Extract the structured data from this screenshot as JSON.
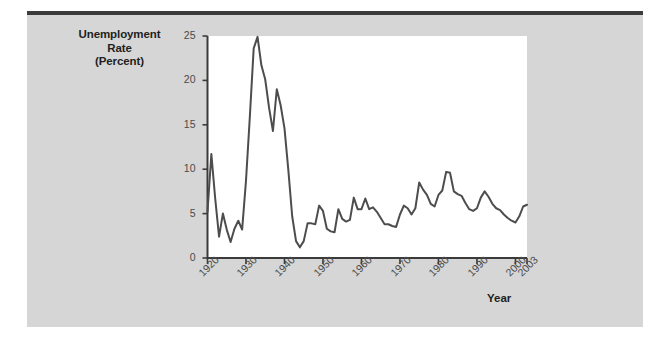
{
  "figure": {
    "background_color": "#d6d6d6",
    "plot_background_color": "#ffffff",
    "line_color": "#4d4d4d",
    "axis_color": "#3b3b3b",
    "text_color": "#231f20",
    "tick_text_color": "#4a4a4a"
  },
  "labels": {
    "y_axis_title_line1": "Unemployment",
    "y_axis_title_line2": "Rate",
    "y_axis_title_line3": "(Percent)",
    "x_axis_title": "Year"
  },
  "chart_data": {
    "type": "line",
    "title": "Unemployment Rate (Percent)",
    "xlabel": "Year",
    "ylabel": "Unemployment Rate (Percent)",
    "xlim": [
      1920,
      2003
    ],
    "ylim": [
      0,
      25
    ],
    "grid": false,
    "legend": "none",
    "y_ticks": [
      0,
      5,
      10,
      15,
      20,
      25
    ],
    "y_tick_labels": [
      "0",
      "5",
      "10",
      "15",
      "20",
      "25"
    ],
    "x_ticks": [
      1920,
      1930,
      1940,
      1950,
      1960,
      1970,
      1980,
      1990,
      2000,
      2003
    ],
    "x_tick_labels": [
      "1920",
      "1930",
      "1940",
      "1950",
      "1960",
      "1970",
      "1980",
      "1990",
      "2000",
      "2003"
    ],
    "series": [
      {
        "name": "Unemployment Rate",
        "x": [
          1920,
          1921,
          1922,
          1923,
          1924,
          1925,
          1926,
          1927,
          1928,
          1929,
          1930,
          1931,
          1932,
          1933,
          1934,
          1935,
          1936,
          1937,
          1938,
          1939,
          1940,
          1941,
          1942,
          1943,
          1944,
          1945,
          1946,
          1947,
          1948,
          1949,
          1950,
          1951,
          1952,
          1953,
          1954,
          1955,
          1956,
          1957,
          1958,
          1959,
          1960,
          1961,
          1962,
          1963,
          1964,
          1965,
          1966,
          1967,
          1968,
          1969,
          1970,
          1971,
          1972,
          1973,
          1974,
          1975,
          1976,
          1977,
          1978,
          1979,
          1980,
          1981,
          1982,
          1983,
          1984,
          1985,
          1986,
          1987,
          1988,
          1989,
          1990,
          1991,
          1992,
          1993,
          1994,
          1995,
          1996,
          1997,
          1998,
          1999,
          2000,
          2001,
          2002,
          2003
        ],
        "values": [
          5.2,
          11.7,
          6.7,
          2.4,
          5.0,
          3.2,
          1.8,
          3.3,
          4.2,
          3.2,
          8.7,
          15.9,
          23.6,
          24.9,
          21.7,
          20.1,
          16.9,
          14.3,
          19.0,
          17.2,
          14.6,
          9.9,
          4.7,
          1.9,
          1.2,
          1.9,
          3.9,
          3.9,
          3.8,
          5.9,
          5.3,
          3.3,
          3.0,
          2.9,
          5.5,
          4.4,
          4.1,
          4.3,
          6.8,
          5.5,
          5.5,
          6.7,
          5.5,
          5.7,
          5.2,
          4.5,
          3.8,
          3.8,
          3.6,
          3.5,
          4.9,
          5.9,
          5.6,
          4.9,
          5.6,
          8.5,
          7.7,
          7.1,
          6.1,
          5.8,
          7.1,
          7.6,
          9.7,
          9.6,
          7.5,
          7.2,
          7.0,
          6.2,
          5.5,
          5.3,
          5.6,
          6.8,
          7.5,
          6.9,
          6.1,
          5.6,
          5.4,
          4.9,
          4.5,
          4.2,
          4.0,
          4.7,
          5.8,
          6.0
        ]
      }
    ]
  }
}
